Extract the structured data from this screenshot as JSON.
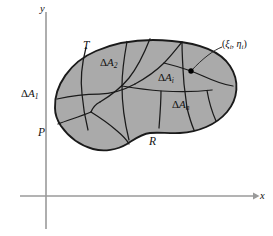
{
  "figure": {
    "kind": "math-diagram-double-integral-partition",
    "background_color": "#ffffff",
    "region_fill_color": "#aaaaaa",
    "region_stroke_color": "#1a1a1a",
    "axis_color": "#9a9a9a"
  },
  "axes": {
    "x_label": "x",
    "y_label": "y"
  },
  "region": {
    "vertex_labels": [
      {
        "id": "T",
        "text": "T"
      },
      {
        "id": "P",
        "text": "P"
      },
      {
        "id": "R",
        "text": "R"
      }
    ]
  },
  "subregions": [
    {
      "id": "a1",
      "delta": "Δ",
      "letter": "A",
      "subscript": "1"
    },
    {
      "id": "a2",
      "delta": "Δ",
      "letter": "A",
      "subscript": "2"
    },
    {
      "id": "ai",
      "delta": "Δ",
      "letter": "A",
      "subscript": "i"
    },
    {
      "id": "an",
      "delta": "Δ",
      "letter": "A",
      "subscript": "n"
    }
  ],
  "sample_point": {
    "label_open": "(",
    "xi": "ξ",
    "xi_sub": "i",
    "comma": ", ",
    "eta": "η",
    "eta_sub": "i",
    "label_close": ")",
    "full_text": "(ξᵢ, ηᵢ)"
  }
}
